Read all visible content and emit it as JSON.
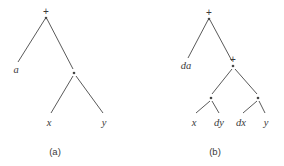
{
  "figure": {
    "background_color": "#ffffff",
    "line_color": "#5a5a5a",
    "text_color": "#3a3a3a",
    "width": 284,
    "height": 166
  },
  "trees": [
    {
      "id": "tree-a",
      "caption": "(a)",
      "caption_x": 55,
      "caption_y": 155,
      "expression": "a + x · y",
      "nodes": [
        {
          "id": "a-root",
          "label": "+",
          "kind": "operator",
          "x": 46,
          "y": 18,
          "label_x": 46,
          "label_y": 15
        },
        {
          "id": "a-leaf-a",
          "label": "a",
          "kind": "leaf",
          "x": 16,
          "y": 66,
          "label_x": 16,
          "label_y": 73
        },
        {
          "id": "a-mul",
          "label": "·",
          "kind": "operator",
          "x": 74,
          "y": 73,
          "label_x": 74,
          "label_y": 76
        },
        {
          "id": "a-leaf-x",
          "label": "x",
          "kind": "leaf",
          "x": 49,
          "y": 116,
          "label_x": 49,
          "label_y": 126
        },
        {
          "id": "a-leaf-y",
          "label": "y",
          "kind": "leaf",
          "x": 104,
          "y": 116,
          "label_x": 104,
          "label_y": 126
        }
      ],
      "edges": [
        {
          "from": "a-root",
          "to": "a-leaf-a",
          "x1": 45,
          "y1": 19,
          "x2": 18,
          "y2": 62
        },
        {
          "from": "a-root",
          "to": "a-mul",
          "x1": 47,
          "y1": 19,
          "x2": 73,
          "y2": 69
        },
        {
          "from": "a-mul",
          "to": "a-leaf-x",
          "x1": 73,
          "y1": 76,
          "x2": 51,
          "y2": 113
        },
        {
          "from": "a-mul",
          "to": "a-leaf-y",
          "x1": 76,
          "y1": 76,
          "x2": 103,
          "y2": 113
        }
      ]
    },
    {
      "id": "tree-b",
      "caption": "(b)",
      "caption_x": 215,
      "caption_y": 155,
      "expression": "da + (x · dy + dx · y)",
      "nodes": [
        {
          "id": "b-root",
          "label": "+",
          "kind": "operator",
          "x": 209,
          "y": 19,
          "label_x": 209,
          "label_y": 16
        },
        {
          "id": "b-leaf-da",
          "label": "da",
          "kind": "leaf",
          "x": 186,
          "y": 62,
          "label_x": 186,
          "label_y": 69
        },
        {
          "id": "b-plus2",
          "label": "+",
          "kind": "operator",
          "x": 233,
          "y": 66,
          "label_x": 233,
          "label_y": 63
        },
        {
          "id": "b-mul1",
          "label": "·",
          "kind": "operator",
          "x": 211,
          "y": 98,
          "label_x": 211,
          "label_y": 101
        },
        {
          "id": "b-mul2",
          "label": "·",
          "kind": "operator",
          "x": 258,
          "y": 98,
          "label_x": 258,
          "label_y": 101
        },
        {
          "id": "b-leaf-x",
          "label": "x",
          "kind": "leaf",
          "x": 194,
          "y": 116,
          "label_x": 194,
          "label_y": 126
        },
        {
          "id": "b-leaf-dy",
          "label": "dy",
          "kind": "leaf",
          "x": 219,
          "y": 116,
          "label_x": 219,
          "label_y": 126
        },
        {
          "id": "b-leaf-dx",
          "label": "dx",
          "kind": "leaf",
          "x": 241,
          "y": 116,
          "label_x": 241,
          "label_y": 126
        },
        {
          "id": "b-leaf-y",
          "label": "y",
          "kind": "leaf",
          "x": 266,
          "y": 116,
          "label_x": 266,
          "label_y": 126
        }
      ],
      "edges": [
        {
          "from": "b-root",
          "to": "b-leaf-da",
          "x1": 208,
          "y1": 20,
          "x2": 188,
          "y2": 58
        },
        {
          "from": "b-root",
          "to": "b-plus2",
          "x1": 210,
          "y1": 20,
          "x2": 232,
          "y2": 61
        },
        {
          "from": "b-plus2",
          "to": "b-mul1",
          "x1": 232,
          "y1": 69,
          "x2": 212,
          "y2": 94
        },
        {
          "from": "b-plus2",
          "to": "b-mul2",
          "x1": 235,
          "y1": 69,
          "x2": 257,
          "y2": 94
        },
        {
          "from": "b-mul1",
          "to": "b-leaf-x",
          "x1": 210,
          "y1": 101,
          "x2": 196,
          "y2": 113
        },
        {
          "from": "b-mul1",
          "to": "b-leaf-dy",
          "x1": 212,
          "y1": 101,
          "x2": 219,
          "y2": 113
        },
        {
          "from": "b-mul2",
          "to": "b-leaf-dx",
          "x1": 257,
          "y1": 101,
          "x2": 243,
          "y2": 113
        },
        {
          "from": "b-mul2",
          "to": "b-leaf-y",
          "x1": 259,
          "y1": 101,
          "x2": 265,
          "y2": 113
        }
      ]
    }
  ]
}
